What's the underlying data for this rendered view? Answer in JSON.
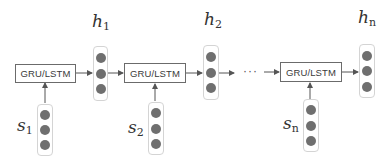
{
  "diagram": {
    "type": "recurrent-encoder",
    "cell_label": "GRU/LSTM",
    "ellipsis": "···",
    "units": [
      {
        "input": {
          "base": "s",
          "sub": "1"
        },
        "output": {
          "base": "h",
          "sub": "1"
        }
      },
      {
        "input": {
          "base": "s",
          "sub": "2"
        },
        "output": {
          "base": "h",
          "sub": "2"
        }
      },
      {
        "input": {
          "base": "s",
          "sub": "n"
        },
        "output": {
          "base": "h",
          "sub": "n"
        }
      }
    ],
    "vector_dims": 3,
    "colors": {
      "cell_border": "#6b6b6b",
      "vector_border": "#d4d4d4",
      "dot": "#6f6f6f",
      "arrow": "#555555"
    }
  }
}
